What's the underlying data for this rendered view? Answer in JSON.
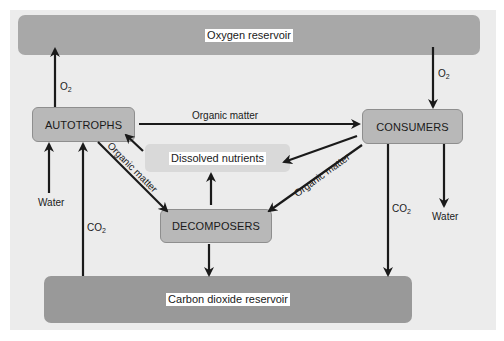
{
  "reservoirs": {
    "oxygen": "Oxygen reservoir",
    "carbon_dioxide": "Carbon dioxide reservoir"
  },
  "nodes": {
    "autotrophs": "AUTOTROPHS",
    "consumers": "CONSUMERS",
    "decomposers": "DECOMPOSERS",
    "dissolved_nutrients": "Dissolved nutrients"
  },
  "flow_labels": {
    "o2_main": "O",
    "o2_sub": "2",
    "co2_main": "CO",
    "co2_sub": "2",
    "water": "Water",
    "organic_matter": "Organic matter"
  },
  "flows": [
    {
      "from": "autotrophs",
      "to": "oxygen reservoir",
      "label": "O2"
    },
    {
      "from": "oxygen reservoir",
      "to": "consumers",
      "label": "O2"
    },
    {
      "from": "autotrophs",
      "to": "consumers",
      "label": "Organic matter"
    },
    {
      "from": "autotrophs",
      "to": "decomposers",
      "label": "Organic matter"
    },
    {
      "from": "consumers",
      "to": "decomposers",
      "label": "Organic matter"
    },
    {
      "from": "consumers",
      "to": "dissolved nutrients",
      "label": ""
    },
    {
      "from": "dissolved nutrients",
      "to": "autotrophs",
      "label": ""
    },
    {
      "from": "decomposers",
      "to": "dissolved nutrients",
      "label": ""
    },
    {
      "from": "decomposers",
      "to": "carbon dioxide reservoir",
      "label": ""
    },
    {
      "from": "water",
      "to": "autotrophs",
      "label": "Water"
    },
    {
      "from": "carbon dioxide reservoir",
      "to": "autotrophs",
      "label": "CO2"
    },
    {
      "from": "consumers",
      "to": "carbon dioxide reservoir",
      "label": "CO2"
    },
    {
      "from": "consumers",
      "to": "water",
      "label": "Water"
    }
  ],
  "colors": {
    "panel": "#ececec",
    "reservoir": "#a8a8a8",
    "node": "#b8b8b8",
    "nutrients": "#d9d9d9",
    "arrow": "#1a1a1a"
  }
}
